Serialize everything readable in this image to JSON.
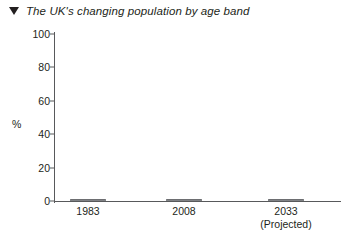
{
  "title": {
    "marker_icon": "triangle-down-icon",
    "text": "The UK's changing population by age band"
  },
  "chart_data": {
    "type": "bar",
    "subtype": "stacked-100-percent",
    "title": "The UK's changing population by age band",
    "xlabel": "",
    "ylabel": "%",
    "ylim": [
      0,
      100
    ],
    "yticks": [
      0,
      20,
      40,
      60,
      80,
      100
    ],
    "grid": false,
    "legend": "none",
    "categories": [
      "1983",
      "2008",
      "2033"
    ],
    "category_sublabels": [
      "",
      "",
      "(Projected)"
    ],
    "series": [
      {
        "name": "Younger age band",
        "color": "#f2f2f2",
        "values": [
          22,
          19,
          19
        ]
      },
      {
        "name": "Middle age band",
        "color": "#d8d8d8",
        "values": [
          62,
          65,
          56
        ]
      },
      {
        "name": "Older age band",
        "color": "#969696",
        "values": [
          16,
          16,
          25
        ]
      }
    ]
  },
  "axis": {
    "y_labels": [
      "100",
      "80",
      "60",
      "40",
      "20",
      "0"
    ],
    "y_title": "%"
  },
  "colors": {
    "segment_light": "#f2f2f2",
    "segment_mid": "#d8d8d8",
    "segment_dark": "#969696",
    "axis": "#58595b",
    "text": "#231f20",
    "outline": "#808285"
  }
}
